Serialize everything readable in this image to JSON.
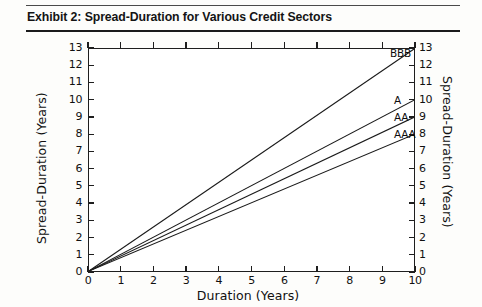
{
  "header": {
    "title": "Exhibit 2: Spread-Duration for Various Credit Sectors"
  },
  "chart_data": {
    "type": "line",
    "title": "Exhibit 2: Spread-Duration for Various Credit Sectors",
    "xlabel": "Duration (Years)",
    "ylabel": "Spread-Duration (Years)",
    "ylabel_right": "Spread-Duration (Years)",
    "xlim": [
      0,
      10
    ],
    "ylim": [
      0,
      13
    ],
    "xticks": [
      0,
      1,
      2,
      3,
      4,
      5,
      6,
      7,
      8,
      9,
      10
    ],
    "yticks": [
      0,
      1,
      2,
      3,
      4,
      5,
      6,
      7,
      8,
      9,
      10,
      11,
      12,
      13
    ],
    "xtick_labels": [
      "0",
      "1",
      "2",
      "3",
      "4",
      "5",
      "6",
      "7",
      "8",
      "9",
      "10"
    ],
    "ytick_labels": [
      "0",
      "1",
      "2",
      "3",
      "4",
      "5",
      "6",
      "7",
      "8",
      "9",
      "10",
      "11",
      "12",
      "13"
    ],
    "grid": false,
    "legend": "inline-end-labels",
    "x": [
      0,
      10
    ],
    "series": [
      {
        "name": "BBB",
        "values": [
          0,
          13
        ],
        "label": "BBB",
        "color": "#1a1a1a"
      },
      {
        "name": "A",
        "values": [
          0,
          10
        ],
        "label": "A",
        "color": "#1a1a1a"
      },
      {
        "name": "AA",
        "values": [
          0,
          9
        ],
        "label": "AA",
        "color": "#1a1a1a"
      },
      {
        "name": "AAA",
        "values": [
          0,
          8
        ],
        "label": "AAA",
        "color": "#1a1a1a"
      }
    ]
  }
}
